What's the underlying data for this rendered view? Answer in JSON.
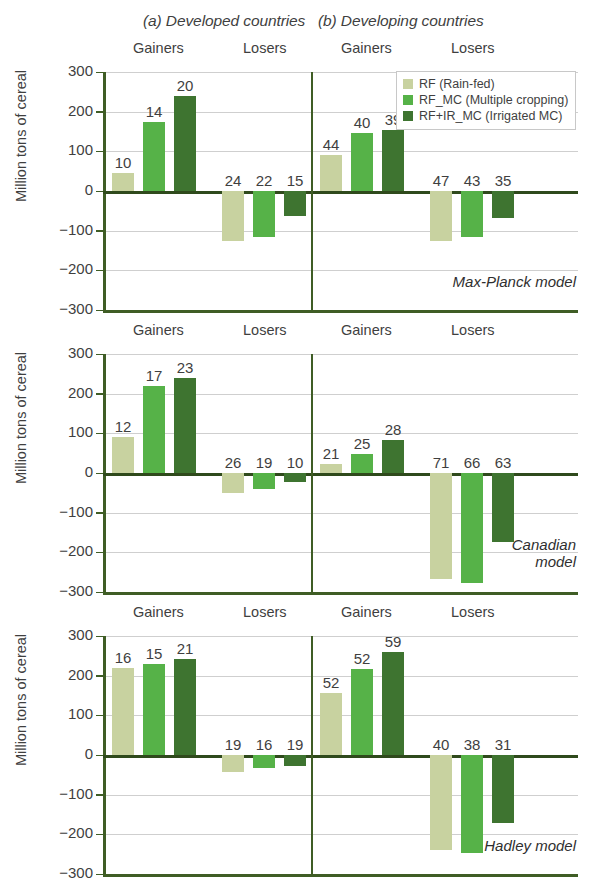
{
  "panels": {
    "a_title": "(a) Developed countries",
    "b_title": "(b) Developing countries"
  },
  "axis": {
    "ylabel": "Million tons of cereal",
    "ticks": [
      "300",
      "200",
      "100",
      "0",
      "−100",
      "−200",
      "−300"
    ]
  },
  "groups": {
    "gainers": "Gainers",
    "losers": "Losers"
  },
  "legend": {
    "items": [
      {
        "label": "RF (Rain-fed)",
        "color": "#c8d2a0",
        "key": "rf"
      },
      {
        "label": "RF_MC (Multiple cropping)",
        "color": "#56b248",
        "key": "rfmc"
      },
      {
        "label": "RF+IR_MC (Irrigated MC)",
        "color": "#3e7430",
        "key": "irmc"
      }
    ]
  },
  "models": [
    {
      "caption": "Max-Planck model"
    },
    {
      "caption": "Canadian\nmodel"
    },
    {
      "caption": "Hadley model"
    }
  ],
  "chart_data": {
    "type": "bar",
    "xlabel": "",
    "ylabel": "Million tons of cereal",
    "ylim": [
      -300,
      300
    ],
    "yticks": [
      300,
      200,
      100,
      0,
      -100,
      -200,
      -300
    ],
    "grid": true,
    "legend_position": "top-right",
    "series_names": [
      "RF (Rain-fed)",
      "RF_MC (Multiple cropping)",
      "RF+IR_MC (Irrigated MC)"
    ],
    "series_colors": [
      "#c8d2a0",
      "#56b248",
      "#3e7430"
    ],
    "panels": [
      {
        "model": "Max-Planck model",
        "regions": [
          {
            "region": "(a) Developed countries",
            "groups": [
              {
                "group": "Gainers",
                "bars": [
                  {
                    "series": "RF (Rain-fed)",
                    "value": 45,
                    "label": "10"
                  },
                  {
                    "series": "RF_MC (Multiple cropping)",
                    "value": 175,
                    "label": "14"
                  },
                  {
                    "series": "RF+IR_MC (Irrigated MC)",
                    "value": 240,
                    "label": "20"
                  }
                ]
              },
              {
                "group": "Losers",
                "bars": [
                  {
                    "series": "RF (Rain-fed)",
                    "value": -127,
                    "label": "24"
                  },
                  {
                    "series": "RF_MC (Multiple cropping)",
                    "value": -115,
                    "label": "22"
                  },
                  {
                    "series": "RF+IR_MC (Irrigated MC)",
                    "value": -63,
                    "label": "15"
                  }
                ]
              }
            ]
          },
          {
            "region": "(b) Developing countries",
            "groups": [
              {
                "group": "Gainers",
                "bars": [
                  {
                    "series": "RF (Rain-fed)",
                    "value": 90,
                    "label": "44"
                  },
                  {
                    "series": "RF_MC (Multiple cropping)",
                    "value": 145,
                    "label": "40"
                  },
                  {
                    "series": "RF+IR_MC (Irrigated MC)",
                    "value": 155,
                    "label": "39"
                  }
                ]
              },
              {
                "group": "Losers",
                "bars": [
                  {
                    "series": "RF (Rain-fed)",
                    "value": -127,
                    "label": "47"
                  },
                  {
                    "series": "RF_MC (Multiple cropping)",
                    "value": -117,
                    "label": "43"
                  },
                  {
                    "series": "RF+IR_MC (Irrigated MC)",
                    "value": -68,
                    "label": "35"
                  }
                ]
              }
            ]
          }
        ]
      },
      {
        "model": "Canadian model",
        "regions": [
          {
            "region": "(a) Developed countries",
            "groups": [
              {
                "group": "Gainers",
                "bars": [
                  {
                    "series": "RF (Rain-fed)",
                    "value": 92,
                    "label": "12"
                  },
                  {
                    "series": "RF_MC (Multiple cropping)",
                    "value": 220,
                    "label": "17"
                  },
                  {
                    "series": "RF+IR_MC (Irrigated MC)",
                    "value": 240,
                    "label": "23"
                  }
                ]
              },
              {
                "group": "Losers",
                "bars": [
                  {
                    "series": "RF (Rain-fed)",
                    "value": -50,
                    "label": "26"
                  },
                  {
                    "series": "RF_MC (Multiple cropping)",
                    "value": -40,
                    "label": "19"
                  },
                  {
                    "series": "RF+IR_MC (Irrigated MC)",
                    "value": -22,
                    "label": "10"
                  }
                ]
              }
            ]
          },
          {
            "region": "(b) Developing countries",
            "groups": [
              {
                "group": "Gainers",
                "bars": [
                  {
                    "series": "RF (Rain-fed)",
                    "value": 23,
                    "label": "21"
                  },
                  {
                    "series": "RF_MC (Multiple cropping)",
                    "value": 48,
                    "label": "25"
                  },
                  {
                    "series": "RF+IR_MC (Irrigated MC)",
                    "value": 82,
                    "label": "28"
                  }
                ]
              },
              {
                "group": "Losers",
                "bars": [
                  {
                    "series": "RF (Rain-fed)",
                    "value": -268,
                    "label": "71"
                  },
                  {
                    "series": "RF_MC (Multiple cropping)",
                    "value": -278,
                    "label": "66"
                  },
                  {
                    "series": "RF+IR_MC (Irrigated MC)",
                    "value": -173,
                    "label": "63"
                  }
                ]
              }
            ]
          }
        ]
      },
      {
        "model": "Hadley model",
        "regions": [
          {
            "region": "(a) Developed countries",
            "groups": [
              {
                "group": "Gainers",
                "bars": [
                  {
                    "series": "RF (Rain-fed)",
                    "value": 220,
                    "label": "16"
                  },
                  {
                    "series": "RF_MC (Multiple cropping)",
                    "value": 230,
                    "label": "15"
                  },
                  {
                    "series": "RF+IR_MC (Irrigated MC)",
                    "value": 242,
                    "label": "21"
                  }
                ]
              },
              {
                "group": "Losers",
                "bars": [
                  {
                    "series": "RF (Rain-fed)",
                    "value": -42,
                    "label": "19"
                  },
                  {
                    "series": "RF_MC (Multiple cropping)",
                    "value": -32,
                    "label": "16"
                  },
                  {
                    "series": "RF+IR_MC (Irrigated MC)",
                    "value": -27,
                    "label": "19"
                  }
                ]
              }
            ]
          },
          {
            "region": "(b) Developing countries",
            "groups": [
              {
                "group": "Gainers",
                "bars": [
                  {
                    "series": "RF (Rain-fed)",
                    "value": 157,
                    "label": "52"
                  },
                  {
                    "series": "RF_MC (Multiple cropping)",
                    "value": 218,
                    "label": "52"
                  },
                  {
                    "series": "RF+IR_MC (Irrigated MC)",
                    "value": 260,
                    "label": "59"
                  }
                ]
              },
              {
                "group": "Losers",
                "bars": [
                  {
                    "series": "RF (Rain-fed)",
                    "value": -240,
                    "label": "40"
                  },
                  {
                    "series": "RF_MC (Multiple cropping)",
                    "value": -248,
                    "label": "38"
                  },
                  {
                    "series": "RF+IR_MC (Irrigated MC)",
                    "value": -172,
                    "label": "31"
                  }
                ]
              }
            ]
          }
        ]
      }
    ]
  }
}
